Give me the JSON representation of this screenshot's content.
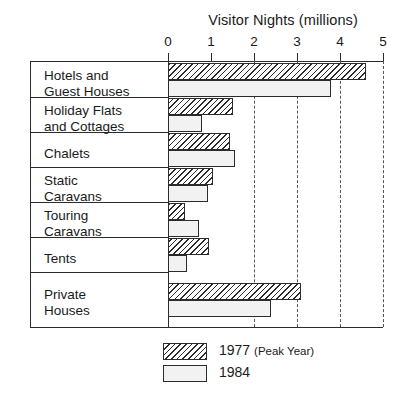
{
  "chart_data": {
    "type": "bar",
    "orientation": "horizontal",
    "title": "Visitor Nights (millions)",
    "xlabel": "Visitor Nights (millions)",
    "ylabel": "",
    "xlim": [
      0,
      5
    ],
    "xticks": [
      "0",
      "1",
      "2",
      "3",
      "4",
      "5"
    ],
    "grid": "vertical dashed gridlines at 2, 3, 4, 5",
    "legend_position": "bottom-center",
    "categories": [
      "Hotels and\nGuest Houses",
      "Holiday Flats\nand Cottages",
      "Chalets",
      "Static\nCaravans",
      "Touring\nCaravans",
      "Tents",
      "Private\nHouses"
    ],
    "series": [
      {
        "name": "1977 (Peak Year)",
        "fill": "diagonal-hatch",
        "values": [
          4.6,
          1.5,
          1.45,
          1.05,
          0.4,
          0.95,
          3.1
        ]
      },
      {
        "name": "1984",
        "fill": "dotted-stipple",
        "values": [
          3.8,
          0.8,
          1.55,
          0.92,
          0.72,
          0.45,
          2.4
        ]
      }
    ]
  },
  "legend": {
    "items": [
      {
        "label_main": "1977",
        "label_sub": "(Peak Year)",
        "swatch": "hatched-swatch"
      },
      {
        "label_main": "1984",
        "label_sub": "",
        "swatch": "dotted-swatch"
      }
    ]
  },
  "colors": {
    "ink": "#2b2b2b",
    "background": "#ffffff",
    "stipple": "#8a8a8a",
    "gridline": "#555555"
  }
}
